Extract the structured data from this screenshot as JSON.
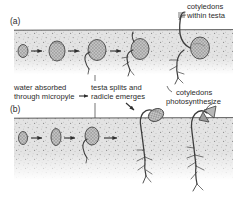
{
  "figure": {
    "background_color": "#ffffff",
    "soil_color": "#dcdcdc",
    "ink_color": "#3a3a3a",
    "width": 233,
    "height": 197
  },
  "panels": [
    {
      "id": "a",
      "label": "(a)",
      "germination_type": "hypogeal",
      "stage_count": 5,
      "soil_line_y": 30
    },
    {
      "id": "b",
      "label": "(b)",
      "germination_type": "epigeal",
      "stage_count": 5,
      "soil_line_y": 118
    }
  ],
  "annotations": [
    {
      "id": "cotyledons-within-testa",
      "lines": [
        "cotyledons",
        "within testa"
      ],
      "line1": "cotyledons",
      "line2": "within testa",
      "panel": "a",
      "align": "left"
    },
    {
      "id": "water-absorbed-through-micropyle",
      "lines": [
        "water absorbed",
        "through micropyle"
      ],
      "line1": "water absorbed",
      "line2": "through micropyle",
      "panel": "both",
      "align": "left"
    },
    {
      "id": "testa-splits-and-radicle-emerges",
      "lines": [
        "testa splits and",
        "radicle emerges"
      ],
      "line1": "testa splits and",
      "line2": "radicle emerges",
      "panel": "both",
      "align": "left"
    },
    {
      "id": "cotyledons-photosynthesize",
      "lines": [
        "cotyledons",
        "photosynthesize"
      ],
      "line1": "cotyledons",
      "line2": "photosynthesize",
      "panel": "b",
      "align": "left"
    }
  ],
  "sequence_arrows": {
    "count": 7,
    "direction": "left-to-right",
    "glyph": "arrow-right"
  }
}
